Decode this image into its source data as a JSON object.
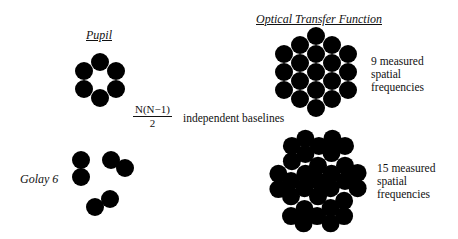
{
  "headers": {
    "pupil": "Pupil",
    "otf": "Optical Transfer Function"
  },
  "labels": {
    "golay": "Golay 6",
    "formula_numerator": "N(N−1)",
    "formula_denominator": "2",
    "formula_suffix": "independent baselines",
    "otf_top_line1": "9 measured",
    "otf_top_line2": "spatial",
    "otf_top_line3": "frequencies",
    "otf_bottom_line1": "15 measured",
    "otf_bottom_line2": "spatial",
    "otf_bottom_line3": "frequencies"
  },
  "colors": {
    "fill": "#000000",
    "background": "#ffffff"
  },
  "geometry": {
    "radius": 9,
    "pupil_ring": {
      "center": [
        100,
        80
      ],
      "points": [
        [
          0,
          -18
        ],
        [
          -16,
          -9
        ],
        [
          16,
          -9
        ],
        [
          -16,
          9
        ],
        [
          16,
          9
        ],
        [
          0,
          18
        ]
      ]
    },
    "golay6": {
      "points": [
        [
          81,
          160
        ],
        [
          81,
          177
        ],
        [
          111,
          160
        ],
        [
          125,
          168
        ],
        [
          95,
          207
        ],
        [
          110,
          199
        ]
      ]
    },
    "otf_top": {
      "center": [
        316,
        72
      ],
      "scale": 1.0
    },
    "otf_bottom": {
      "center": [
        318,
        181
      ],
      "scale": 1.0
    }
  }
}
